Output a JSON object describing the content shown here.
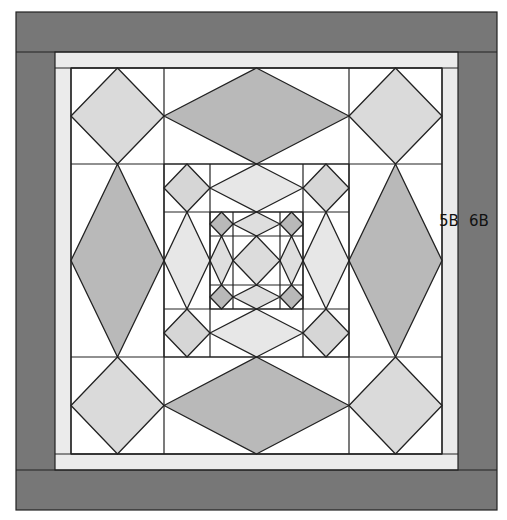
{
  "canvas": {
    "width": 507,
    "height": 520,
    "background": "#ffffff"
  },
  "colors": {
    "outer_border": "#777777",
    "inner_band": "#ebebeb",
    "background": "#ffffff",
    "stroke": "#222222",
    "level1_corner_diamond": "#dadada",
    "level1_long_diamond": "#b9b9b9",
    "level2_corner_diamond": "#d6d6d6",
    "level2_long_diamond": "#e7e7e7",
    "level3_corner_diamond": "#b9b9b9",
    "level3_long_diamond": "#dedede",
    "level3_center_diamond": "#dcdcdc"
  },
  "borders": {
    "outer": {
      "x": 16,
      "y": 12,
      "w": 481,
      "h": 498
    },
    "band": {
      "x": 55,
      "y": 52,
      "w": 403,
      "h": 418
    },
    "inner": {
      "x": 71,
      "y": 68,
      "w": 371,
      "h": 386
    }
  },
  "levels": [
    {
      "name": "outer-ring",
      "xs": [
        71,
        164,
        349,
        442
      ],
      "ys": [
        68,
        164,
        357,
        454
      ],
      "corner": "level1_corner_diamond",
      "long": "level1_long_diamond"
    },
    {
      "name": "middle-ring",
      "xs": [
        164,
        210,
        303,
        349
      ],
      "ys": [
        164,
        212,
        309,
        357
      ],
      "corner": "level2_corner_diamond",
      "long": "level2_long_diamond"
    },
    {
      "name": "inner-ring",
      "xs": [
        210,
        233,
        280,
        303
      ],
      "ys": [
        212,
        236,
        285,
        309
      ],
      "corner": "level3_corner_diamond",
      "long": "level3_long_diamond",
      "center": "level3_center_diamond"
    }
  ],
  "labels": [
    {
      "id": "label-5b",
      "text": "5B",
      "x": 439,
      "y": 214
    },
    {
      "id": "label-6b",
      "text": "6B",
      "x": 469,
      "y": 214
    }
  ]
}
